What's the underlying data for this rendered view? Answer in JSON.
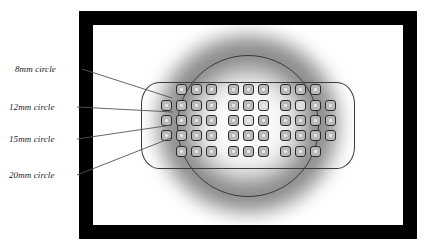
{
  "figure": {
    "type": "annotated-diagram",
    "background_color": "#ffffff",
    "frame_color": "#000000",
    "leader_line_color": "#555555",
    "label_text_color": "#1a1a1a"
  },
  "annotations": [
    {
      "id": "c8",
      "label": "8mm circle",
      "diameter_mm": 8,
      "x": 15,
      "y": 64
    },
    {
      "id": "c12",
      "label": "12mm circle",
      "diameter_mm": 12,
      "x": 9,
      "y": 102
    },
    {
      "id": "c15",
      "label": "15mm circle",
      "diameter_mm": 15,
      "x": 9,
      "y": 134
    },
    {
      "id": "c20",
      "label": "20mm circle",
      "diameter_mm": 20,
      "x": 9,
      "y": 170
    }
  ],
  "keypad": {
    "rows": [
      {
        "row": 1,
        "keys": 9,
        "groups": [
          3,
          3,
          3
        ]
      },
      {
        "row": 2,
        "keys": 11,
        "groups": [
          4,
          3,
          4
        ]
      },
      {
        "row": 3,
        "keys": 11,
        "groups": [
          4,
          3,
          4
        ]
      },
      {
        "row": 4,
        "keys": 11,
        "groups": [
          4,
          3,
          4
        ]
      },
      {
        "row": 5,
        "keys": 9,
        "groups": [
          3,
          3,
          3
        ]
      }
    ],
    "key_border_color": "#2b2b2b",
    "key_fill_color": "#b9b9b9",
    "key_pip_color": "#e8e8e8",
    "body_outline_color": "#3b3b3b"
  },
  "glow": {
    "center_x": 155,
    "center_y": 99,
    "ring_color": "#3a3a3a",
    "halo_color": "#787878",
    "core_color": "#ffffff"
  }
}
